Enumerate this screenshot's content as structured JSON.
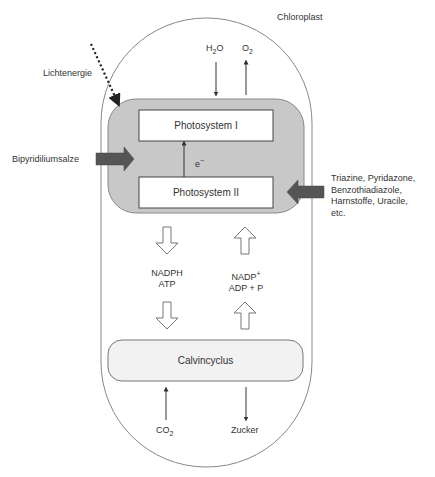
{
  "title": "Chloroplast",
  "labels": {
    "chloroplast": "Chloroplast",
    "light_energy": "Lichtenergie",
    "water": "H",
    "water_sub": "2",
    "water_tail": "O",
    "oxygen": "O",
    "oxygen_sub": "2",
    "photosystem_1": "Photosystem I",
    "photosystem_2": "Photosystem II",
    "electron": "e",
    "electron_sup": "−",
    "bipyridilium": "Bipyridiliumsalze",
    "inhibitors": [
      "Triazine, Pyridazone,",
      "Benzothiadiazole,",
      "Harnstoffe, Uracile,",
      "etc."
    ],
    "nadph": "NADPH",
    "atp": "ATP",
    "nadp": "NADP",
    "nadp_sup": "+",
    "adp": "ADP + P",
    "calvin": "Calvincyclus",
    "co2": "CO",
    "co2_sub": "2",
    "sugar": "Zucker"
  },
  "colors": {
    "outline": "#888888",
    "thylakoid_fill": "#c8c8c8",
    "calvin_fill": "#f2f2f2",
    "block_arrow": "#555555",
    "line": "#333333"
  }
}
